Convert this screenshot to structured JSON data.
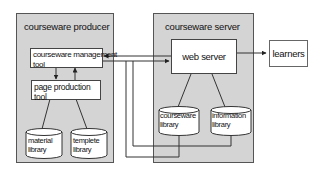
{
  "producer": {
    "title": "courseware producer",
    "management_tool": [
      "courseware management",
      "tool"
    ],
    "page_tool": [
      "page production",
      "tool"
    ],
    "material_library": [
      "material",
      "library"
    ],
    "template_library": [
      "templete",
      "library"
    ]
  },
  "server": {
    "title": "courseware server",
    "web_server": "web server",
    "courseware_library": [
      "courseware",
      "library"
    ],
    "information_library": [
      "information",
      "library"
    ]
  },
  "learners": {
    "label": "learners"
  },
  "colors": {
    "panel_bg": "#d4d4d4",
    "line": "#333333",
    "box_bg": "#ffffff"
  }
}
